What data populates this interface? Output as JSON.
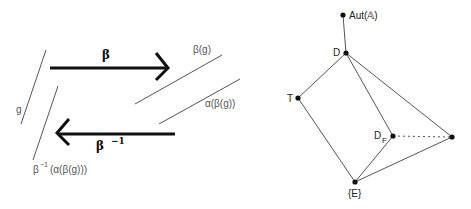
{
  "left_diagram": {
    "labels": {
      "g": "g",
      "beta": "β",
      "beta_g": "β(g)",
      "alpha_beta_g": "α(β(g))",
      "beta_inv": "β",
      "beta_inv_exp": "−1",
      "result_prefix": "β",
      "result_exp": "−1",
      "result_body": "(α(β(g)))"
    },
    "arrows": [
      {
        "name": "forward",
        "label": "β",
        "direction": "right"
      },
      {
        "name": "backward",
        "label": "β⁻¹",
        "direction": "left"
      }
    ]
  },
  "right_diagram": {
    "nodes": [
      {
        "id": "aut",
        "label": "Aut(𝔸)"
      },
      {
        "id": "D",
        "label": "D"
      },
      {
        "id": "T",
        "label": "T"
      },
      {
        "id": "DF",
        "label": "D",
        "sub": "F"
      },
      {
        "id": "R",
        "label": ""
      },
      {
        "id": "E",
        "label": "{E}"
      }
    ],
    "edges": [
      [
        "aut",
        "D"
      ],
      [
        "D",
        "T"
      ],
      [
        "D",
        "DF"
      ],
      [
        "D",
        "R"
      ],
      [
        "T",
        "E"
      ],
      [
        "DF",
        "E"
      ],
      [
        "R",
        "E"
      ]
    ],
    "dotted_edges": [
      [
        "DF",
        "R"
      ]
    ]
  },
  "colors": {
    "line": "#555555",
    "arrow": "#111111",
    "node": "#111111"
  }
}
